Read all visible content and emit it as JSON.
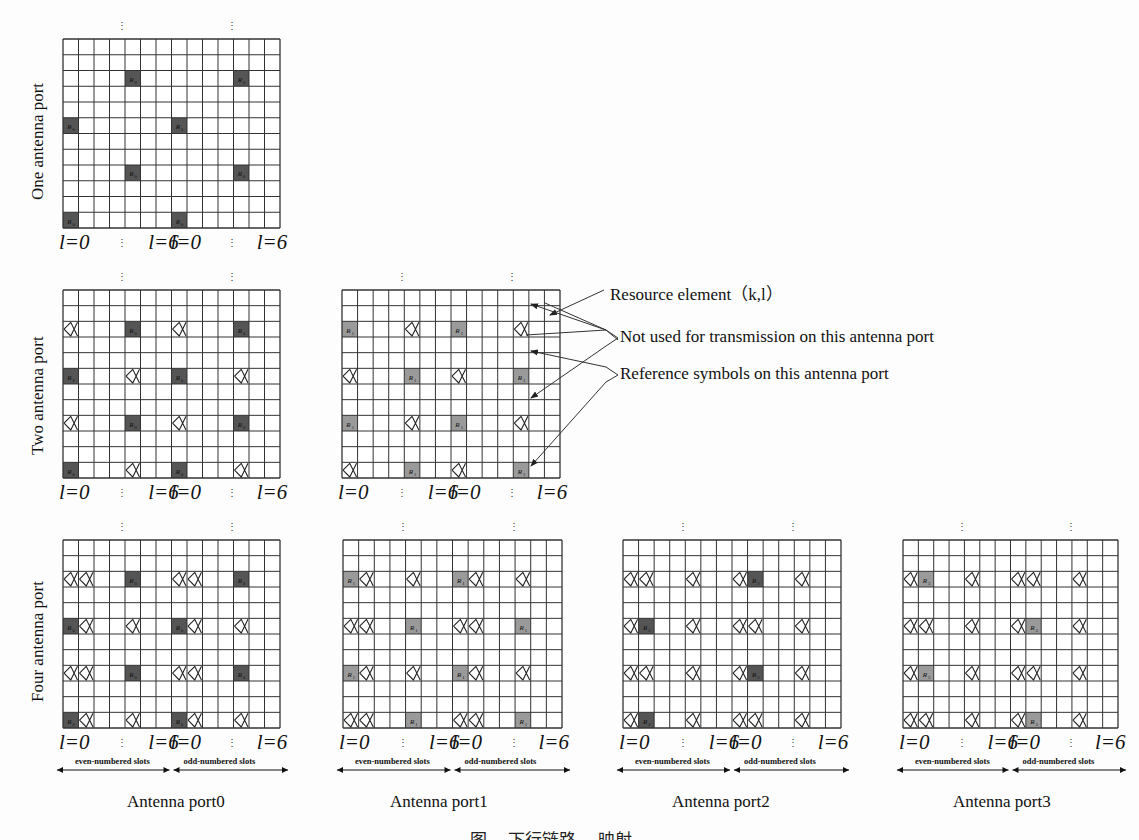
{
  "figure": {
    "rows": {
      "one": "One antenna port",
      "two": "Two antenna port",
      "four": "Four antenna port"
    },
    "axis": {
      "l0": "l=0",
      "l6": "l=6",
      "dots": "⋮"
    },
    "legend": {
      "resource_element": "Resource element（k,l）",
      "not_used": "Not used for transmission on this antenna port",
      "reference": "Reference symbols on this antenna port"
    },
    "slots": {
      "even": "even-numbered slots",
      "odd": "odd-numbered slots"
    },
    "ports": [
      "Antenna port0",
      "Antenna port1",
      "Antenna port2",
      "Antenna port3"
    ],
    "caption": "图 ...  下行链路 ... 映射",
    "grid": {
      "cols": 14,
      "rows": 12
    },
    "colors": {
      "ref_dark": "#555555",
      "ref_light": "#9a9a9a",
      "line": "#333333"
    },
    "grids": [
      {
        "id": "one-port",
        "x": 63,
        "y": 39,
        "w": 217,
        "h": 189,
        "shade": "dark",
        "ref_label": "R0",
        "refs": [
          [
            2,
            4
          ],
          [
            2,
            11
          ],
          [
            5,
            0
          ],
          [
            5,
            7
          ],
          [
            8,
            4
          ],
          [
            8,
            11
          ],
          [
            11,
            0
          ],
          [
            11,
            7
          ]
        ],
        "nots": []
      },
      {
        "id": "two-port-p0",
        "x": 63,
        "y": 290,
        "w": 217,
        "h": 188,
        "shade": "dark",
        "ref_label": "R0",
        "refs": [
          [
            2,
            4
          ],
          [
            2,
            11
          ],
          [
            5,
            0
          ],
          [
            5,
            7
          ],
          [
            8,
            4
          ],
          [
            8,
            11
          ],
          [
            11,
            0
          ],
          [
            11,
            7
          ]
        ],
        "nots": [
          [
            2,
            0
          ],
          [
            2,
            7
          ],
          [
            5,
            4
          ],
          [
            5,
            11
          ],
          [
            8,
            0
          ],
          [
            8,
            7
          ],
          [
            11,
            4
          ],
          [
            11,
            11
          ]
        ]
      },
      {
        "id": "two-port-p1",
        "x": 342,
        "y": 290,
        "w": 218,
        "h": 188,
        "shade": "light",
        "ref_label": "R1",
        "refs": [
          [
            2,
            0
          ],
          [
            2,
            7
          ],
          [
            5,
            4
          ],
          [
            5,
            11
          ],
          [
            8,
            0
          ],
          [
            8,
            7
          ],
          [
            11,
            4
          ],
          [
            11,
            11
          ]
        ],
        "nots": [
          [
            2,
            4
          ],
          [
            2,
            11
          ],
          [
            5,
            0
          ],
          [
            5,
            7
          ],
          [
            8,
            4
          ],
          [
            8,
            11
          ],
          [
            11,
            0
          ],
          [
            11,
            7
          ]
        ]
      },
      {
        "id": "four-port-p0",
        "x": 63,
        "y": 540,
        "w": 217,
        "h": 188,
        "shade": "dark",
        "ref_label": "R0",
        "refs": [
          [
            2,
            4
          ],
          [
            2,
            11
          ],
          [
            5,
            0
          ],
          [
            5,
            7
          ],
          [
            8,
            4
          ],
          [
            8,
            11
          ],
          [
            11,
            0
          ],
          [
            11,
            7
          ]
        ],
        "nots": [
          [
            2,
            0
          ],
          [
            2,
            1
          ],
          [
            2,
            7
          ],
          [
            2,
            8
          ],
          [
            5,
            1
          ],
          [
            5,
            4
          ],
          [
            5,
            8
          ],
          [
            5,
            11
          ],
          [
            8,
            0
          ],
          [
            8,
            1
          ],
          [
            8,
            7
          ],
          [
            8,
            8
          ],
          [
            11,
            1
          ],
          [
            11,
            4
          ],
          [
            11,
            8
          ],
          [
            11,
            11
          ]
        ]
      },
      {
        "id": "four-port-p1",
        "x": 343,
        "y": 540,
        "w": 219,
        "h": 188,
        "shade": "light",
        "ref_label": "R1",
        "refs": [
          [
            2,
            0
          ],
          [
            2,
            7
          ],
          [
            5,
            4
          ],
          [
            5,
            11
          ],
          [
            8,
            0
          ],
          [
            8,
            7
          ],
          [
            11,
            4
          ],
          [
            11,
            11
          ]
        ],
        "nots": [
          [
            2,
            1
          ],
          [
            2,
            4
          ],
          [
            2,
            8
          ],
          [
            2,
            11
          ],
          [
            5,
            0
          ],
          [
            5,
            1
          ],
          [
            5,
            7
          ],
          [
            5,
            8
          ],
          [
            8,
            1
          ],
          [
            8,
            4
          ],
          [
            8,
            8
          ],
          [
            8,
            11
          ],
          [
            11,
            0
          ],
          [
            11,
            1
          ],
          [
            11,
            7
          ],
          [
            11,
            8
          ]
        ]
      },
      {
        "id": "four-port-p2",
        "x": 623,
        "y": 540,
        "w": 218,
        "h": 188,
        "shade": "dark",
        "ref_label": "R2",
        "refs": [
          [
            2,
            8
          ],
          [
            5,
            1
          ],
          [
            8,
            8
          ],
          [
            11,
            1
          ]
        ],
        "nots": [
          [
            2,
            0
          ],
          [
            2,
            1
          ],
          [
            2,
            4
          ],
          [
            2,
            7
          ],
          [
            2,
            11
          ],
          [
            5,
            0
          ],
          [
            5,
            4
          ],
          [
            5,
            7
          ],
          [
            5,
            8
          ],
          [
            5,
            11
          ],
          [
            8,
            0
          ],
          [
            8,
            1
          ],
          [
            8,
            4
          ],
          [
            8,
            7
          ],
          [
            8,
            11
          ],
          [
            11,
            0
          ],
          [
            11,
            4
          ],
          [
            11,
            7
          ],
          [
            11,
            8
          ],
          [
            11,
            11
          ]
        ]
      },
      {
        "id": "four-port-p3",
        "x": 903,
        "y": 540,
        "w": 215,
        "h": 188,
        "shade": "light",
        "ref_label": "R3",
        "refs": [
          [
            2,
            1
          ],
          [
            5,
            8
          ],
          [
            8,
            1
          ],
          [
            11,
            8
          ]
        ],
        "nots": [
          [
            2,
            0
          ],
          [
            2,
            4
          ],
          [
            2,
            7
          ],
          [
            2,
            8
          ],
          [
            2,
            11
          ],
          [
            5,
            0
          ],
          [
            5,
            1
          ],
          [
            5,
            4
          ],
          [
            5,
            7
          ],
          [
            5,
            11
          ],
          [
            8,
            0
          ],
          [
            8,
            4
          ],
          [
            8,
            7
          ],
          [
            8,
            8
          ],
          [
            8,
            11
          ],
          [
            11,
            0
          ],
          [
            11,
            1
          ],
          [
            11,
            4
          ],
          [
            11,
            7
          ],
          [
            11,
            11
          ]
        ]
      }
    ]
  }
}
